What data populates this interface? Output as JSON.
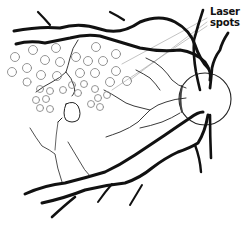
{
  "diagram": {
    "label": {
      "line1": "Laser",
      "line2": "spots"
    },
    "colors": {
      "vessel": "#111111",
      "laser_spot": "#8a8a8a",
      "leader_line": "#9a9a9a",
      "optic_disc": "#222222",
      "background": "#ffffff"
    },
    "laser_spots": [
      {
        "cx": 33,
        "cy": 50,
        "r": 4.5
      },
      {
        "cx": 56,
        "cy": 48,
        "r": 4.5
      },
      {
        "cx": 96,
        "cy": 47,
        "r": 4.5
      },
      {
        "cx": 116,
        "cy": 54,
        "r": 4.5
      },
      {
        "cx": 15,
        "cy": 57,
        "r": 4.5
      },
      {
        "cx": 45,
        "cy": 60,
        "r": 4.5
      },
      {
        "cx": 60,
        "cy": 62,
        "r": 4.5
      },
      {
        "cx": 76,
        "cy": 57,
        "r": 4.5
      },
      {
        "cx": 88,
        "cy": 61,
        "r": 4.5
      },
      {
        "cx": 103,
        "cy": 61,
        "r": 4.5
      },
      {
        "cx": 116,
        "cy": 71,
        "r": 4.5
      },
      {
        "cx": 12,
        "cy": 72,
        "r": 4.5
      },
      {
        "cx": 27,
        "cy": 68,
        "r": 4.5
      },
      {
        "cx": 41,
        "cy": 75,
        "r": 4.5
      },
      {
        "cx": 57,
        "cy": 76,
        "r": 4.5
      },
      {
        "cx": 80,
        "cy": 73,
        "r": 4.5
      },
      {
        "cx": 95,
        "cy": 73,
        "r": 4.5
      },
      {
        "cx": 110,
        "cy": 82,
        "r": 4.5
      },
      {
        "cx": 127,
        "cy": 81,
        "r": 4.5
      },
      {
        "cx": 27,
        "cy": 82,
        "r": 4
      },
      {
        "cx": 40,
        "cy": 89,
        "r": 3.5
      },
      {
        "cx": 50,
        "cy": 91,
        "r": 3.5
      },
      {
        "cx": 63,
        "cy": 90,
        "r": 3.5
      },
      {
        "cx": 72,
        "cy": 85,
        "r": 3.5
      },
      {
        "cx": 78,
        "cy": 93,
        "r": 3.5
      },
      {
        "cx": 84,
        "cy": 84,
        "r": 3.5
      },
      {
        "cx": 95,
        "cy": 89,
        "r": 3.5
      },
      {
        "cx": 98,
        "cy": 98,
        "r": 3.5
      },
      {
        "cx": 107,
        "cy": 95,
        "r": 3.5
      },
      {
        "cx": 36,
        "cy": 100,
        "r": 3.5
      },
      {
        "cx": 46,
        "cy": 99,
        "r": 3.5
      },
      {
        "cx": 40,
        "cy": 108,
        "r": 3.5
      },
      {
        "cx": 50,
        "cy": 109,
        "r": 3.5
      },
      {
        "cx": 91,
        "cy": 104,
        "r": 3.5
      },
      {
        "cx": 100,
        "cy": 107,
        "r": 3.5
      }
    ]
  }
}
